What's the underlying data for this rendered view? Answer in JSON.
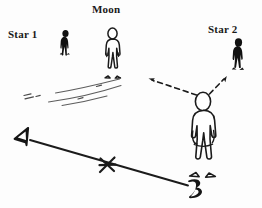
{
  "figure": {
    "background_color": "#fdfdfd",
    "ink_color": "#1a1a1a",
    "width": 262,
    "height": 208
  },
  "labels": {
    "star1": "Star 1",
    "moon": "Moon",
    "star2": "Star 2",
    "point_a": "A",
    "point_b": "B"
  },
  "figures": {
    "star1_person": {
      "style": "filled-silhouette",
      "x": 60,
      "y": 30
    },
    "moon_person": {
      "style": "outline",
      "x": 103,
      "y": 28
    },
    "star2_person": {
      "style": "filled-silhouette",
      "x": 232,
      "y": 38
    },
    "observer_person": {
      "style": "outline",
      "x": 190,
      "y": 92
    }
  },
  "annotations": {
    "sight_line_left": "dashed arrow toward Star 1 side",
    "sight_line_right": "dashed arrow toward Star 2",
    "baseline": "solid line from A to B",
    "x_mark": "asterisk cross mark on baseline",
    "ground_shadow": "sketched ground lines under Moon figure"
  }
}
